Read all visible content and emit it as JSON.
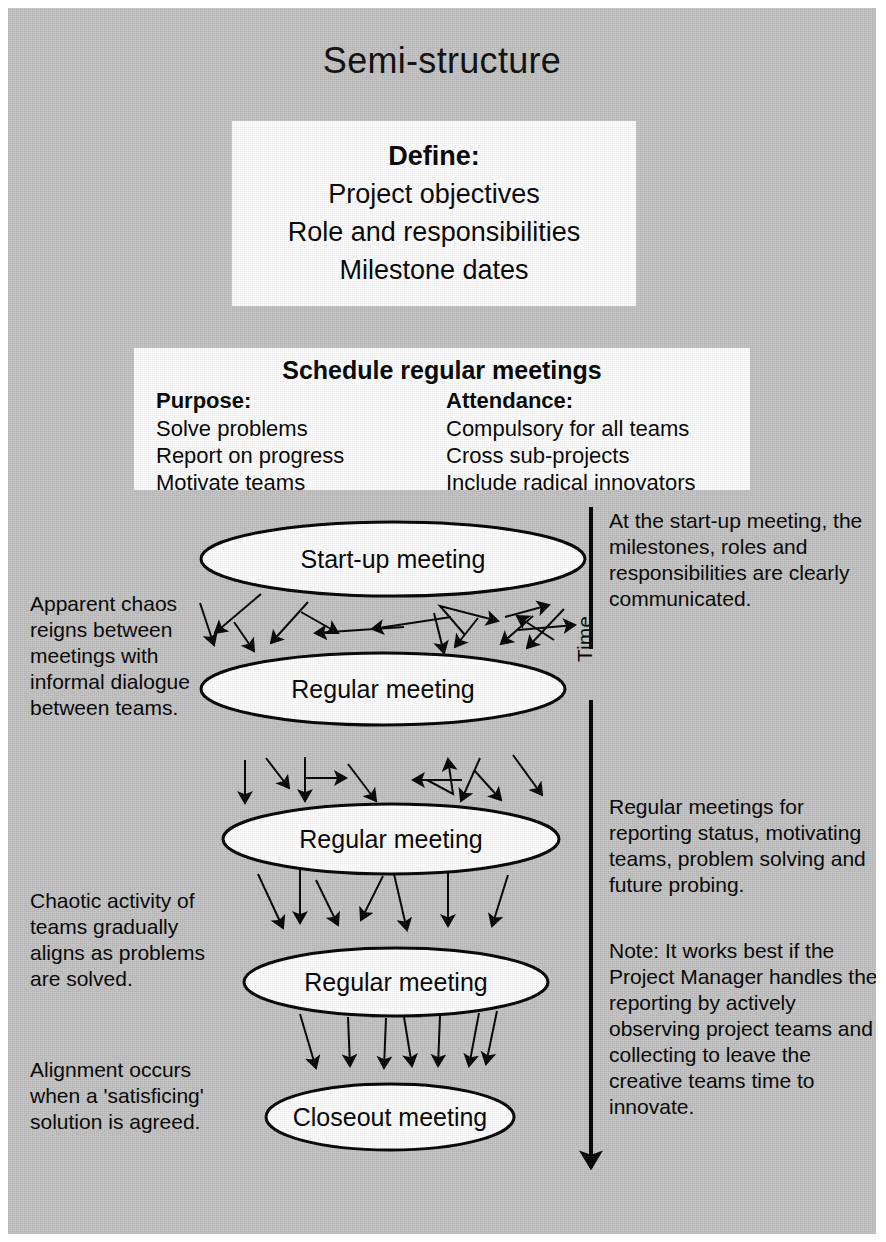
{
  "page": {
    "title": "Semi-structure",
    "background_color": "#c2c2c2",
    "box_color": "#ffffff",
    "text_color": "#000000"
  },
  "define_box": {
    "heading": "Define:",
    "lines": [
      "Project objectives",
      "Role and responsibilities",
      "Milestone dates"
    ]
  },
  "meetings_box": {
    "heading": "Schedule regular meetings",
    "columns": [
      {
        "heading": "Purpose:",
        "items": [
          "Solve problems",
          "Report on progress",
          "Motivate teams"
        ]
      },
      {
        "heading": "Attendance:",
        "items": [
          "Compulsory for all teams",
          "Cross sub-projects",
          "Include radical innovators"
        ]
      }
    ]
  },
  "timeline": {
    "axis_label": "Time",
    "nodes": [
      {
        "label": "Start-up meeting"
      },
      {
        "label": "Regular meeting"
      },
      {
        "label": "Regular meeting"
      },
      {
        "label": "Regular meeting"
      },
      {
        "label": "Closeout meeting"
      }
    ]
  },
  "left_notes": [
    "Apparent chaos reigns between meetings with informal dialogue between teams.",
    "Chaotic activity of teams gradually aligns as problems are solved.",
    "Alignment occurs when a 'satisficing' solution is agreed."
  ],
  "right_notes": [
    "At the start-up meeting, the milestones, roles and responsibilities are clearly communicated.",
    "Regular meetings for reporting status, motivating teams, problem solving and future probing.",
    "Note: It works best if the Project Manager handles the reporting by actively observing project teams and collecting to leave the creative teams time to innovate."
  ]
}
